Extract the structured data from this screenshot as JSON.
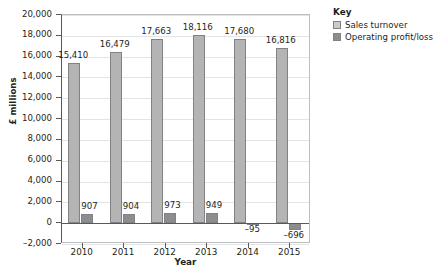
{
  "chart_data": {
    "type": "bar",
    "title": "",
    "xlabel": "Year",
    "ylabel": "£ millions",
    "categories": [
      "2010",
      "2011",
      "2012",
      "2013",
      "2014",
      "2015"
    ],
    "series": [
      {
        "name": "Sales turnover",
        "color": "#b4b4b4",
        "values": [
          15410,
          16479,
          17663,
          18116,
          17680,
          16816
        ],
        "labels": [
          "15,410",
          "16,479",
          "17,663",
          "18,116",
          "17,680",
          "16,816"
        ]
      },
      {
        "name": "Operating profit/loss",
        "color": "#8d8d8d",
        "values": [
          907,
          904,
          973,
          949,
          -95,
          -696
        ],
        "labels": [
          "907",
          "904",
          "973",
          "949",
          "–95",
          "–696"
        ]
      }
    ],
    "ylim": [
      -2000,
      20000
    ],
    "ytick_values": [
      20000,
      18000,
      16000,
      14000,
      12000,
      10000,
      8000,
      6000,
      4000,
      2000,
      0,
      -2000
    ],
    "ytick_labels": [
      "20,000",
      "18,000",
      "16,000",
      "14,000",
      "12,000",
      "10,000",
      "8,000",
      "6,000",
      "4,000",
      "2,000",
      "0",
      "–2,000"
    ],
    "grid": true,
    "legend_position": "right"
  },
  "legend": {
    "title": "Key",
    "entries": [
      {
        "label": "Sales turnover"
      },
      {
        "label": "Operating profit/loss"
      }
    ]
  }
}
